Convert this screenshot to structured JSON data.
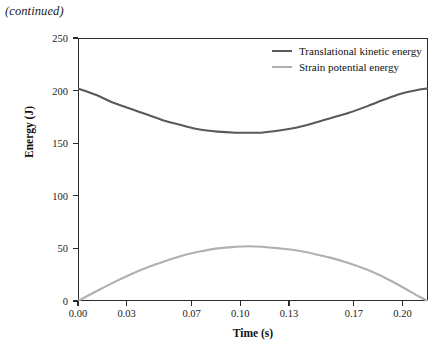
{
  "page": {
    "continued_note": "(continued)"
  },
  "chart_data": {
    "type": "line",
    "title": "",
    "xlabel": "Time (s)",
    "ylabel": "Energy (J)",
    "xlim": [
      0.0,
      0.2157
    ],
    "ylim": [
      0,
      250
    ],
    "grid": false,
    "legend_position": "top-right-inside",
    "xticks": [
      0.0,
      0.03,
      0.07,
      0.1,
      0.13,
      0.17,
      0.2
    ],
    "xtick_labels": [
      "0.00",
      "0.03",
      "0.07",
      "0.10",
      "0.13",
      "0.17",
      "0.20"
    ],
    "yticks": [
      0,
      50,
      100,
      150,
      200,
      250
    ],
    "ytick_labels": [
      "0",
      "50",
      "100",
      "150",
      "200",
      "250"
    ],
    "series": [
      {
        "name": "Translational kinetic energy",
        "color": "#5a5a5a",
        "x": [
          0.0,
          0.011,
          0.021,
          0.032,
          0.043,
          0.054,
          0.064,
          0.075,
          0.086,
          0.097,
          0.105,
          0.113,
          0.124,
          0.135,
          0.145,
          0.156,
          0.167,
          0.178,
          0.188,
          0.199,
          0.2105,
          0.2157
        ],
        "y": [
          202,
          196,
          189,
          183,
          177,
          171,
          167,
          163,
          161,
          160,
          160,
          160,
          162,
          165,
          169,
          174,
          179,
          185,
          191,
          197,
          201,
          202
        ]
      },
      {
        "name": "Strain potential energy",
        "color": "#b0b0b0",
        "x": [
          0.0,
          0.011,
          0.021,
          0.032,
          0.043,
          0.054,
          0.064,
          0.075,
          0.086,
          0.097,
          0.105,
          0.113,
          0.124,
          0.135,
          0.145,
          0.156,
          0.167,
          0.178,
          0.188,
          0.199,
          0.2105,
          0.2157
        ],
        "y": [
          0,
          9,
          17,
          25,
          32,
          38,
          43,
          47,
          50,
          51.5,
          52,
          51.5,
          50,
          48,
          45,
          41,
          36,
          30,
          23,
          14,
          4,
          0
        ]
      }
    ]
  },
  "legend": {
    "items": [
      {
        "label": "Translational kinetic energy",
        "color": "#5a5a5a"
      },
      {
        "label": "Strain potential energy",
        "color": "#b0b0b0"
      }
    ]
  }
}
